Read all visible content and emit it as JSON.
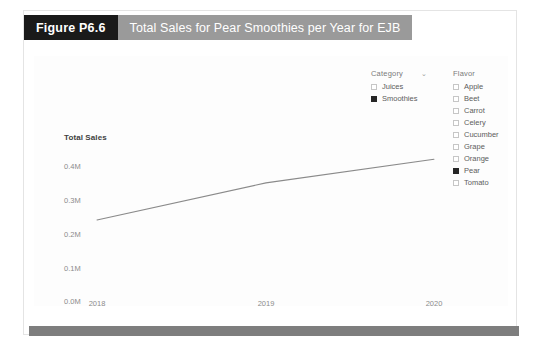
{
  "header": {
    "figure_tag": "Figure P6.6",
    "title": "Total Sales for Pear Smoothies per Year for EJB"
  },
  "filters": {
    "category": {
      "label": "Category",
      "chevron": "⌄",
      "options": [
        {
          "label": "Juices",
          "checked": false
        },
        {
          "label": "Smoothies",
          "checked": true
        }
      ]
    },
    "flavor": {
      "label": "Flavor",
      "options": [
        {
          "label": "Apple",
          "checked": false
        },
        {
          "label": "Beet",
          "checked": false
        },
        {
          "label": "Carrot",
          "checked": false
        },
        {
          "label": "Celery",
          "checked": false
        },
        {
          "label": "Cucumber",
          "checked": false
        },
        {
          "label": "Grape",
          "checked": false
        },
        {
          "label": "Orange",
          "checked": false
        },
        {
          "label": "Pear",
          "checked": true
        },
        {
          "label": "Tomato",
          "checked": false
        }
      ]
    }
  },
  "colors": {
    "figure_tag_bg": "#1a1a1a",
    "title_bg": "#9a9a9a",
    "line": "#8a8a8a",
    "checked_box": "#262626",
    "footer_bar": "#7e7e7e",
    "tick_text": "#8b8b8b"
  },
  "chart_data": {
    "type": "line",
    "title": "Total Sales for Pear Smoothies per Year for EJB",
    "xlabel": "",
    "ylabel": "Total Sales",
    "x": [
      "2018",
      "2019",
      "2020"
    ],
    "categories": [
      "2018",
      "2019",
      "2020"
    ],
    "series": [
      {
        "name": "Pear Smoothies",
        "values": [
          0.24,
          0.35,
          0.42
        ]
      }
    ],
    "values": [
      0.24,
      0.35,
      0.42
    ],
    "ytick_labels": [
      "0.4M",
      "0.3M",
      "0.2M",
      "0.1M",
      "0.0M"
    ],
    "ytick_values": [
      0.4,
      0.3,
      0.2,
      0.1,
      0.0
    ],
    "xtick_labels": [
      "2018",
      "2019",
      "2020"
    ],
    "ylim": [
      0.0,
      0.45
    ],
    "grid": false,
    "legend_position": "right",
    "units": "millions"
  }
}
